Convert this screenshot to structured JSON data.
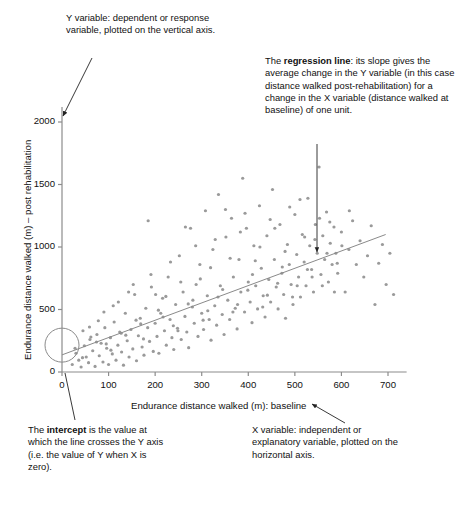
{
  "figure": {
    "type": "annotated-scatter-diagram",
    "background": "#ffffff"
  },
  "annotations": [
    {
      "name": "y-variable-annotation",
      "segments": [
        {
          "text": "Y variable: dependent or response variable, plotted on the vertical axis.",
          "bold": false
        }
      ],
      "full_text": "Y variable: dependent or response variable, plotted on the vertical axis."
    },
    {
      "name": "regression-line-annotation",
      "pre": "The ",
      "bold": "regression line",
      "post": ": its slope gives the average change in the Y variable (in this case distance walked post-rehabilitation) for a change in the X variable (distance walked at baseline) of one unit.",
      "full_text": "The regression line: its slope gives the average change in the Y variable (in this case distance walked post-rehabilitation) for a change in the X variable (distance walked at baseline) of one unit."
    },
    {
      "name": "intercept-annotation",
      "pre": "The ",
      "bold": "intercept",
      "post": " is the value at which the line crosses the Y axis (i.e. the value of Y when X is zero).",
      "full_text": "The intercept is the value at which the line crosses the Y axis (i.e. the value of Y when X is zero)."
    },
    {
      "name": "x-variable-annotation",
      "full_text": "X variable: independent or explanatory variable, plotted on the horizontal axis."
    }
  ],
  "chart_data": {
    "type": "scatter",
    "title": "",
    "xlabel": "Endurance distance walked (m): baseline",
    "ylabel": "Endurance distance walked (m) – post rehabilitation",
    "xlim": [
      0,
      740
    ],
    "ylim": [
      0,
      2120
    ],
    "xticks": [
      0,
      100,
      200,
      300,
      400,
      500,
      600,
      700
    ],
    "yticks": [
      0,
      500,
      1000,
      1500,
      2000
    ],
    "xtick_labels": [
      "0",
      "100",
      "200",
      "300",
      "400",
      "500",
      "600",
      "700"
    ],
    "ytick_labels": [
      "0",
      "500",
      "1000",
      "1500",
      "2000"
    ],
    "grid": false,
    "legend": false,
    "point_color": "#9a9a9a",
    "point_size": 3.2,
    "line_color": "#8a8a8a",
    "axis_color": "#8c8c8c",
    "regression_line": {
      "intercept": 137,
      "slope": 0.63,
      "x_start": 0,
      "x_end": 695,
      "y_start": 137,
      "y_end": 1100
    },
    "highlight_circle": {
      "name": "intercept-highlight",
      "cx": 0,
      "cy": 215,
      "r_px": 17
    },
    "points": [
      [
        22,
        60
      ],
      [
        30,
        150
      ],
      [
        36,
        95
      ],
      [
        41,
        40
      ],
      [
        48,
        210
      ],
      [
        52,
        120
      ],
      [
        57,
        75
      ],
      [
        60,
        260
      ],
      [
        66,
        170
      ],
      [
        71,
        45
      ],
      [
        75,
        300
      ],
      [
        80,
        130
      ],
      [
        84,
        230
      ],
      [
        88,
        80
      ],
      [
        92,
        355
      ],
      [
        96,
        190
      ],
      [
        100,
        60
      ],
      [
        104,
        275
      ],
      [
        108,
        145
      ],
      [
        112,
        400
      ],
      [
        116,
        95
      ],
      [
        120,
        215
      ],
      [
        124,
        320
      ],
      [
        128,
        160
      ],
      [
        132,
        55
      ],
      [
        136,
        470
      ],
      [
        140,
        250
      ],
      [
        144,
        120
      ],
      [
        148,
        340
      ],
      [
        152,
        185
      ],
      [
        156,
        620
      ],
      [
        160,
        90
      ],
      [
        164,
        290
      ],
      [
        168,
        430
      ],
      [
        172,
        200
      ],
      [
        176,
        135
      ],
      [
        180,
        510
      ],
      [
        184,
        355
      ],
      [
        188,
        245
      ],
      [
        192,
        680
      ],
      [
        196,
        165
      ],
      [
        200,
        390
      ],
      [
        204,
        285
      ],
      [
        208,
        150
      ],
      [
        212,
        470
      ],
      [
        216,
        590
      ],
      [
        220,
        330
      ],
      [
        224,
        215
      ],
      [
        228,
        760
      ],
      [
        232,
        420
      ],
      [
        236,
        275
      ],
      [
        240,
        180
      ],
      [
        244,
        540
      ],
      [
        248,
        350
      ],
      [
        252,
        930
      ],
      [
        256,
        260
      ],
      [
        260,
        640
      ],
      [
        264,
        445
      ],
      [
        268,
        320
      ],
      [
        272,
        195
      ],
      [
        276,
        1150
      ],
      [
        280,
        520
      ],
      [
        284,
        390
      ],
      [
        288,
        700
      ],
      [
        292,
        285
      ],
      [
        296,
        860
      ],
      [
        300,
        470
      ],
      [
        304,
        340
      ],
      [
        308,
        1290
      ],
      [
        312,
        610
      ],
      [
        316,
        420
      ],
      [
        320,
        255
      ],
      [
        324,
        980
      ],
      [
        328,
        530
      ],
      [
        332,
        375
      ],
      [
        336,
        1420
      ],
      [
        340,
        690
      ],
      [
        344,
        460
      ],
      [
        348,
        300
      ],
      [
        352,
        1080
      ],
      [
        356,
        575
      ],
      [
        360,
        420
      ],
      [
        364,
        1230
      ],
      [
        368,
        760
      ],
      [
        372,
        510
      ],
      [
        376,
        345
      ],
      [
        380,
        900
      ],
      [
        384,
        640
      ],
      [
        388,
        1550
      ],
      [
        392,
        480
      ],
      [
        396,
        1150
      ],
      [
        400,
        720
      ],
      [
        404,
        560
      ],
      [
        408,
        395
      ],
      [
        412,
        1010
      ],
      [
        416,
        690
      ],
      [
        420,
        505
      ],
      [
        424,
        1330
      ],
      [
        428,
        830
      ],
      [
        432,
        610
      ],
      [
        436,
        440
      ],
      [
        440,
        1090
      ],
      [
        444,
        740
      ],
      [
        448,
        560
      ],
      [
        452,
        1460
      ],
      [
        456,
        900
      ],
      [
        460,
        680
      ],
      [
        464,
        505
      ],
      [
        468,
        1180
      ],
      [
        472,
        790
      ],
      [
        476,
        620
      ],
      [
        480,
        430
      ],
      [
        484,
        1020
      ],
      [
        488,
        860
      ],
      [
        492,
        700
      ],
      [
        496,
        540
      ],
      [
        500,
        1260
      ],
      [
        504,
        940
      ],
      [
        508,
        760
      ],
      [
        512,
        600
      ],
      [
        516,
        1100
      ],
      [
        520,
        880
      ],
      [
        524,
        690
      ],
      [
        528,
        1390
      ],
      [
        532,
        1010
      ],
      [
        536,
        820
      ],
      [
        540,
        640
      ],
      [
        544,
        1180
      ],
      [
        548,
        950
      ],
      [
        552,
        1640
      ],
      [
        556,
        780
      ],
      [
        560,
        1090
      ],
      [
        564,
        900
      ],
      [
        568,
        1280
      ],
      [
        572,
        720
      ],
      [
        576,
        1030
      ],
      [
        580,
        860
      ],
      [
        584,
        1160
      ],
      [
        588,
        950
      ],
      [
        592,
        790
      ],
      [
        600,
        1120
      ],
      [
        608,
        640
      ],
      [
        616,
        980
      ],
      [
        624,
        1210
      ],
      [
        632,
        860
      ],
      [
        640,
        1050
      ],
      [
        648,
        760
      ],
      [
        656,
        930
      ],
      [
        664,
        1170
      ],
      [
        672,
        540
      ],
      [
        680,
        870
      ],
      [
        688,
        1020
      ],
      [
        696,
        700
      ],
      [
        704,
        950
      ],
      [
        712,
        620
      ],
      [
        45,
        330
      ],
      [
        62,
        280
      ],
      [
        78,
        410
      ],
      [
        95,
        225
      ],
      [
        110,
        530
      ],
      [
        127,
        310
      ],
      [
        143,
        640
      ],
      [
        159,
        415
      ],
      [
        175,
        265
      ],
      [
        191,
        780
      ],
      [
        207,
        495
      ],
      [
        223,
        605
      ],
      [
        239,
        370
      ],
      [
        255,
        720
      ],
      [
        271,
        545
      ],
      [
        287,
        1010
      ],
      [
        303,
        415
      ],
      [
        319,
        835
      ],
      [
        335,
        600
      ],
      [
        351,
        1300
      ],
      [
        367,
        480
      ],
      [
        383,
        1120
      ],
      [
        399,
        655
      ],
      [
        415,
        890
      ],
      [
        431,
        520
      ],
      [
        447,
        1220
      ],
      [
        463,
        710
      ],
      [
        479,
        965
      ],
      [
        495,
        600
      ],
      [
        511,
        1380
      ],
      [
        527,
        820
      ],
      [
        543,
        1060
      ],
      [
        559,
        690
      ],
      [
        575,
        1200
      ],
      [
        591,
        870
      ],
      [
        28,
        190
      ],
      [
        44,
        115
      ],
      [
        59,
        360
      ],
      [
        74,
        240
      ],
      [
        90,
        480
      ],
      [
        105,
        175
      ],
      [
        121,
        560
      ],
      [
        137,
        295
      ],
      [
        153,
        700
      ],
      [
        169,
        385
      ],
      [
        185,
        1210
      ],
      [
        201,
        620
      ],
      [
        217,
        440
      ],
      [
        233,
        880
      ],
      [
        249,
        330
      ],
      [
        265,
        1160
      ],
      [
        281,
        575
      ],
      [
        297,
        745
      ],
      [
        313,
        490
      ],
      [
        329,
        1060
      ],
      [
        345,
        660
      ],
      [
        361,
        910
      ],
      [
        377,
        540
      ],
      [
        393,
        1270
      ],
      [
        409,
        780
      ],
      [
        425,
        1000
      ],
      [
        441,
        615
      ],
      [
        457,
        1150
      ],
      [
        473,
        840
      ],
      [
        489,
        1320
      ],
      [
        505,
        690
      ],
      [
        521,
        1080
      ],
      [
        537,
        760
      ],
      [
        553,
        1230
      ],
      [
        569,
        950
      ],
      [
        585,
        640
      ],
      [
        601,
        1010
      ],
      [
        617,
        1290
      ]
    ]
  }
}
